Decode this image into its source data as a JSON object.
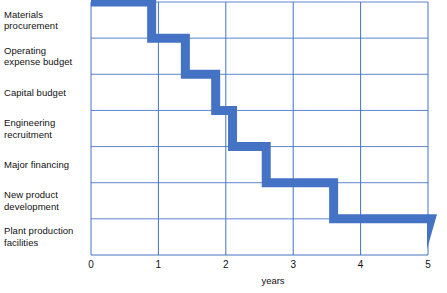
{
  "chart_data": {
    "type": "bar",
    "title": "",
    "subtitle": "",
    "xlabel": "years",
    "ylabel": "",
    "xlim": [
      0,
      5
    ],
    "xticks": [
      0,
      1,
      2,
      3,
      4,
      5
    ],
    "xtick_labels": [
      "0",
      "1",
      "2",
      "3",
      "4",
      "5"
    ],
    "grid": true,
    "legend": null,
    "orientation": "horizontal",
    "style": "staircase-cascade",
    "bar_color": "#4472C4",
    "grid_color": "#4472C4",
    "categories": [
      "Materials\nprocurement",
      "Operating\nexpense budget",
      "Capital budget",
      "Engineering\nrecruitment",
      "Major financing",
      "New product\ndevelopment",
      "Plant production\nfacilities"
    ],
    "values": [
      0.9,
      1.4,
      1.85,
      2.1,
      2.6,
      3.6,
      5.0
    ]
  },
  "axis": {
    "x_title": "years",
    "ticks": [
      "0",
      "1",
      "2",
      "3",
      "4",
      "5"
    ]
  },
  "rows": [
    {
      "label": "Materials\nprocurement"
    },
    {
      "label": "Operating\nexpense budget"
    },
    {
      "label": "Capital budget"
    },
    {
      "label": "Engineering\nrecruitment"
    },
    {
      "label": "Major financing"
    },
    {
      "label": "New product\ndevelopment"
    },
    {
      "label": "Plant production\nfacilities"
    }
  ],
  "colors": {
    "bar": "#4472C4",
    "grid": "#4472C4",
    "text": "#111111",
    "background": "#ffffff"
  }
}
